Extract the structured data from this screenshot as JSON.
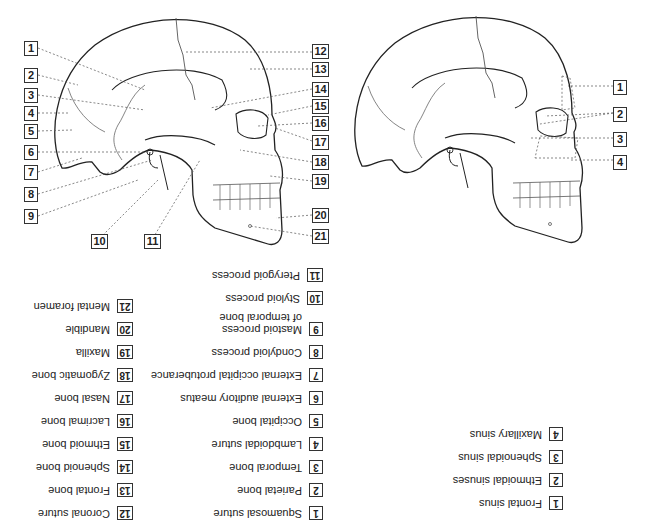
{
  "diagram": {
    "left_skull": {
      "name": "Skull bones and landmarks",
      "markers": [
        "1",
        "2",
        "3",
        "4",
        "5",
        "6",
        "7",
        "8",
        "9",
        "10",
        "11",
        "12",
        "13",
        "14",
        "15",
        "16",
        "17",
        "18",
        "19",
        "20",
        "21"
      ]
    },
    "right_skull": {
      "name": "Paranasal sinuses",
      "markers": [
        "1",
        "2",
        "3",
        "4"
      ]
    }
  },
  "legend": {
    "bones": [
      {
        "num": "1",
        "label": "Squamosal suture"
      },
      {
        "num": "2",
        "label": "Parietal bone"
      },
      {
        "num": "3",
        "label": "Temporal bone"
      },
      {
        "num": "4",
        "label": "Lambdoidal suture"
      },
      {
        "num": "5",
        "label": "Occipital bone"
      },
      {
        "num": "6",
        "label": "External auditory meatus"
      },
      {
        "num": "7",
        "label": "External occipital protuberance"
      },
      {
        "num": "8",
        "label": "Condyloid process"
      },
      {
        "num": "9",
        "label": "Mastoid process\nof temporal bone"
      },
      {
        "num": "10",
        "label": "Styloid process"
      },
      {
        "num": "11",
        "label": "Pterygoid process"
      }
    ],
    "bones_2": [
      {
        "num": "12",
        "label": "Coronal suture"
      },
      {
        "num": "13",
        "label": "Frontal bone"
      },
      {
        "num": "14",
        "label": "Sphenoid bone"
      },
      {
        "num": "15",
        "label": "Ethmoid bone"
      },
      {
        "num": "16",
        "label": "Lacrimal bone"
      },
      {
        "num": "17",
        "label": "Nasal bone"
      },
      {
        "num": "18",
        "label": "Zygomatic bone"
      },
      {
        "num": "19",
        "label": "Maxilla"
      },
      {
        "num": "20",
        "label": "Mandible"
      },
      {
        "num": "21",
        "label": "Mental foramen"
      }
    ],
    "sinuses": [
      {
        "num": "1",
        "label": "Frontal sinus"
      },
      {
        "num": "2",
        "label": "Ethmoidal sinuses"
      },
      {
        "num": "3",
        "label": "Sphenoidal sinus"
      },
      {
        "num": "4",
        "label": "Maxillary sinus"
      }
    ]
  }
}
